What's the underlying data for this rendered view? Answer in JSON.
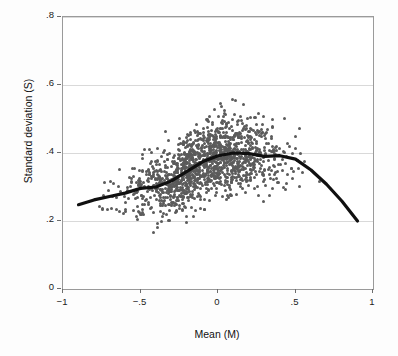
{
  "chart_data": {
    "type": "scatter",
    "title": "",
    "xlabel": "Mean (M)",
    "ylabel": "Standard deviation (S)",
    "xlim": [
      -1,
      1
    ],
    "ylim": [
      0,
      0.8
    ],
    "xticks": [
      -1,
      -0.5,
      0,
      0.5,
      1
    ],
    "xticklabels": [
      "−1",
      "−.5",
      "0",
      ".5",
      "1"
    ],
    "yticks": [
      0,
      0.2,
      0.4,
      0.6,
      0.8
    ],
    "yticklabels": [
      "0",
      ".2",
      ".4",
      ".6",
      ".8"
    ],
    "grid": "horizontal",
    "point_color": "#5b5b5b",
    "line_color": "#101010",
    "series": [
      {
        "name": "lowess-fit",
        "type": "line",
        "x": [
          -0.9,
          -0.8,
          -0.7,
          -0.6,
          -0.5,
          -0.4,
          -0.3,
          -0.2,
          -0.1,
          0.0,
          0.1,
          0.2,
          0.3,
          0.4,
          0.5,
          0.6,
          0.7,
          0.8,
          0.9
        ],
        "y": [
          0.248,
          0.262,
          0.272,
          0.282,
          0.296,
          0.3,
          0.318,
          0.346,
          0.374,
          0.392,
          0.4,
          0.398,
          0.39,
          0.392,
          0.382,
          0.35,
          0.308,
          0.258,
          0.2
        ]
      },
      {
        "name": "observations",
        "type": "scatter",
        "n_points": 1400,
        "x_range": [
          -0.93,
          0.92
        ],
        "y_range": [
          0.06,
          0.81
        ],
        "description": "Dense cloud of study-level points; spread widest near M = 0 where S reaches ~0.8, narrowing toward |M| = 1."
      }
    ]
  },
  "axis": {
    "y_title": "Standard deviation (S)",
    "x_title": "Mean (M)"
  }
}
